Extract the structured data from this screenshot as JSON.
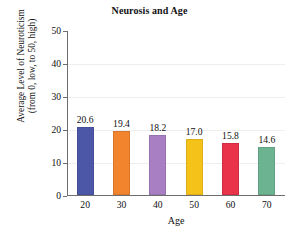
{
  "chart_data": {
    "type": "bar",
    "title": "Neurosis and Age",
    "xlabel": "Age",
    "ylabel_line1": "Average Level of Neuroticism",
    "ylabel_line2": "(from 0, low, to 50, high)",
    "categories": [
      "20",
      "30",
      "40",
      "50",
      "60",
      "70"
    ],
    "values": [
      20.6,
      19.4,
      18.2,
      17.0,
      15.8,
      14.6
    ],
    "value_labels": [
      "20.6",
      "19.4",
      "18.2",
      "17.0",
      "15.8",
      "14.6"
    ],
    "ylim": [
      0,
      50
    ],
    "yticks": [
      0,
      10,
      20,
      30,
      40,
      50
    ],
    "ytick_labels": [
      "0",
      "10",
      "20",
      "30",
      "40",
      "50"
    ],
    "gridlines": [
      10,
      20,
      30,
      40
    ],
    "grid": true,
    "legend": "none",
    "bar_colors": [
      "#4d57a8",
      "#f2842e",
      "#a97fc4",
      "#f5c21a",
      "#e8334a",
      "#6cb491"
    ],
    "axis_color": "#6e6e6e",
    "grid_color": "#eeeeee",
    "background": "#ffffff"
  }
}
